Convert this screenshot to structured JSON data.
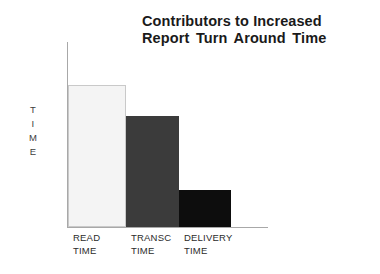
{
  "chart_data": {
    "type": "bar",
    "title_lines": [
      "Contributors to Increased",
      "Report Turn Around Time"
    ],
    "categories": [
      "READ\nTIME",
      "TRANSC\nTIME",
      "DELIVERY\nTIME"
    ],
    "category_labels_flat": [
      "READ TIME",
      "TRANSC TIME",
      "DELIVERY TIME"
    ],
    "values": [
      100,
      78,
      26
    ],
    "xlabel": "",
    "ylabel": "TIME",
    "ylabel_letters": [
      "T",
      "I",
      "M",
      "E"
    ],
    "ylim": [
      0,
      130
    ],
    "grid": false,
    "legend": false,
    "axis_tick_labels": [],
    "bar_colors": [
      "#f4f4f4",
      "#3b3b3b",
      "#0d0d0d"
    ],
    "bar_border_colors": [
      "#c9c9c9",
      "none",
      "none"
    ],
    "axis_color": "#a8a8a8",
    "text_color": "#1a1a1a",
    "background": "#ffffff"
  }
}
